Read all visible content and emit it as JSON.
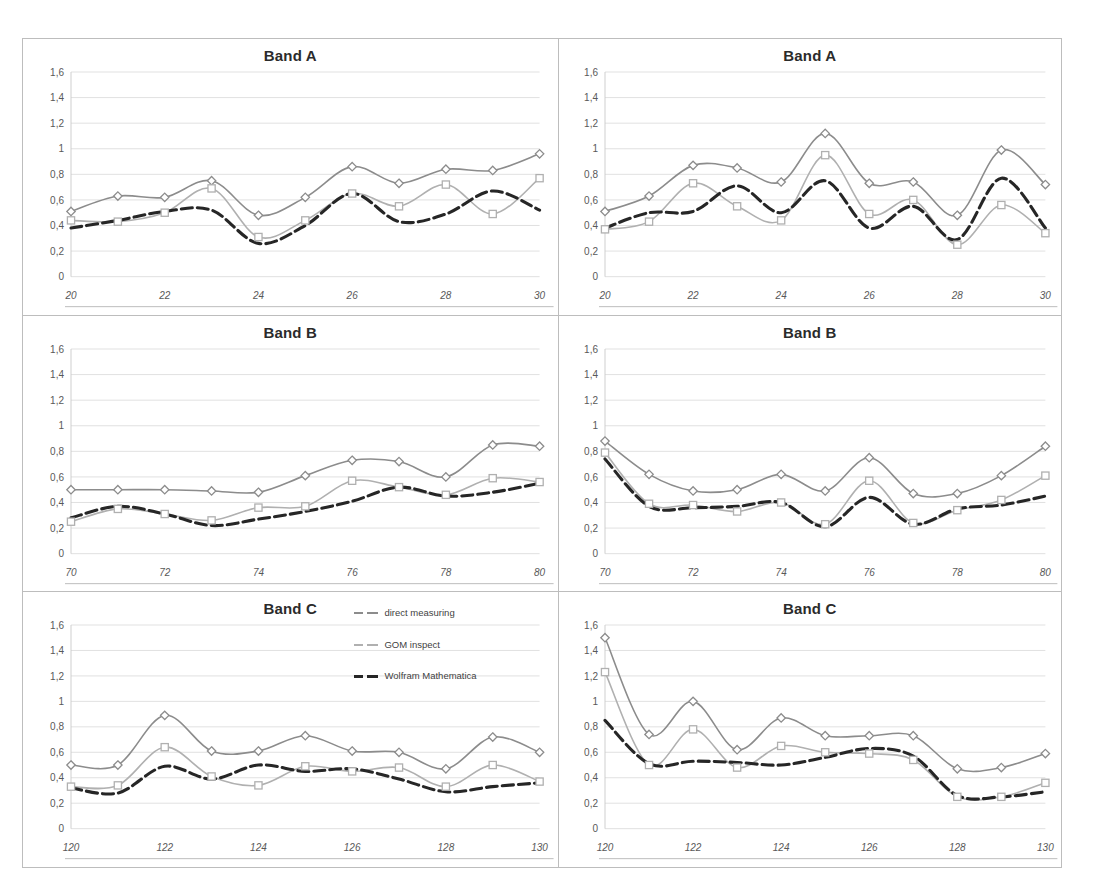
{
  "figure": {
    "panel_count": 6,
    "background": "#ffffff",
    "border_color": "#bdbdbd"
  },
  "legend": {
    "position": "bottom-left-panel-top-right",
    "items": [
      {
        "label": "direct measuring",
        "color": "#8c8c8c",
        "marker": "diamond"
      },
      {
        "label": "GOM inspect",
        "color": "#b0b0b0",
        "marker": "square"
      },
      {
        "label": "Wolfram Mathematica",
        "color": "#262626",
        "marker": "none"
      }
    ]
  },
  "axes": {
    "y_ticks": [
      "0",
      "0,2",
      "0,4",
      "0,6",
      "0,8",
      "1",
      "1,2",
      "1,4",
      "1,6"
    ],
    "y_values": [
      0,
      0.2,
      0.4,
      0.6,
      0.8,
      1.0,
      1.2,
      1.4,
      1.6
    ],
    "ylim": [
      0,
      1.6
    ],
    "grid": true,
    "grid_color": "#d9d9d9"
  },
  "chart_data": [
    {
      "id": "band-a-left",
      "type": "line",
      "title": "Band A",
      "xlabel": "",
      "ylabel": "",
      "xlim": [
        20,
        30
      ],
      "ylim": [
        0,
        1.6
      ],
      "x": [
        20,
        21,
        22,
        23,
        24,
        25,
        26,
        27,
        28,
        29,
        30
      ],
      "x_ticks": [
        "20",
        "22",
        "24",
        "26",
        "28",
        "30"
      ],
      "x_tick_values": [
        20,
        22,
        24,
        26,
        28,
        30
      ],
      "series": [
        {
          "name": "direct measuring",
          "values": [
            0.51,
            0.63,
            0.62,
            0.75,
            0.48,
            0.62,
            0.86,
            0.73,
            0.84,
            0.83,
            0.96
          ]
        },
        {
          "name": "GOM inspect",
          "values": [
            0.44,
            0.43,
            0.5,
            0.69,
            0.31,
            0.44,
            0.65,
            0.55,
            0.72,
            0.49,
            0.77
          ]
        },
        {
          "name": "Wolfram Mathematica",
          "values": [
            0.38,
            0.44,
            0.51,
            0.52,
            0.26,
            0.4,
            0.65,
            0.43,
            0.49,
            0.67,
            0.52
          ]
        }
      ]
    },
    {
      "id": "band-a-right",
      "type": "line",
      "title": "Band A",
      "xlabel": "",
      "ylabel": "",
      "xlim": [
        20,
        30
      ],
      "ylim": [
        0,
        1.6
      ],
      "x": [
        20,
        21,
        22,
        23,
        24,
        25,
        26,
        27,
        28,
        29,
        30
      ],
      "x_ticks": [
        "20",
        "22",
        "24",
        "26",
        "28",
        "30"
      ],
      "x_tick_values": [
        20,
        22,
        24,
        26,
        28,
        30
      ],
      "series": [
        {
          "name": "direct measuring",
          "values": [
            0.51,
            0.63,
            0.87,
            0.85,
            0.74,
            1.12,
            0.73,
            0.74,
            0.48,
            0.99,
            0.72
          ]
        },
        {
          "name": "GOM inspect",
          "values": [
            0.37,
            0.43,
            0.73,
            0.55,
            0.44,
            0.95,
            0.49,
            0.6,
            0.25,
            0.56,
            0.34
          ]
        },
        {
          "name": "Wolfram Mathematica",
          "values": [
            0.38,
            0.5,
            0.51,
            0.71,
            0.5,
            0.75,
            0.38,
            0.55,
            0.29,
            0.77,
            0.38
          ]
        }
      ]
    },
    {
      "id": "band-b-left",
      "type": "line",
      "title": "Band B",
      "xlabel": "",
      "ylabel": "",
      "xlim": [
        70,
        80
      ],
      "ylim": [
        0,
        1.6
      ],
      "x": [
        70,
        71,
        72,
        73,
        74,
        75,
        76,
        77,
        78,
        79,
        80
      ],
      "x_ticks": [
        "70",
        "72",
        "74",
        "76",
        "78",
        "80"
      ],
      "x_tick_values": [
        70,
        72,
        74,
        76,
        78,
        80
      ],
      "series": [
        {
          "name": "direct measuring",
          "values": [
            0.5,
            0.5,
            0.5,
            0.49,
            0.48,
            0.61,
            0.73,
            0.72,
            0.6,
            0.85,
            0.84
          ]
        },
        {
          "name": "GOM inspect",
          "values": [
            0.25,
            0.35,
            0.31,
            0.26,
            0.36,
            0.37,
            0.57,
            0.52,
            0.46,
            0.59,
            0.56
          ]
        },
        {
          "name": "Wolfram Mathematica",
          "values": [
            0.28,
            0.37,
            0.31,
            0.22,
            0.27,
            0.33,
            0.41,
            0.52,
            0.45,
            0.48,
            0.55
          ]
        }
      ]
    },
    {
      "id": "band-b-right",
      "type": "line",
      "title": "Band B",
      "xlabel": "",
      "ylabel": "",
      "xlim": [
        70,
        80
      ],
      "ylim": [
        0,
        1.6
      ],
      "x": [
        70,
        71,
        72,
        73,
        74,
        75,
        76,
        77,
        78,
        79,
        80
      ],
      "x_ticks": [
        "70",
        "72",
        "74",
        "76",
        "78",
        "80"
      ],
      "x_tick_values": [
        70,
        72,
        74,
        76,
        78,
        80
      ],
      "series": [
        {
          "name": "direct measuring",
          "values": [
            0.88,
            0.62,
            0.49,
            0.5,
            0.62,
            0.49,
            0.75,
            0.47,
            0.47,
            0.61,
            0.84
          ]
        },
        {
          "name": "GOM inspect",
          "values": [
            0.79,
            0.39,
            0.38,
            0.33,
            0.4,
            0.23,
            0.57,
            0.24,
            0.34,
            0.42,
            0.61
          ]
        },
        {
          "name": "Wolfram Mathematica",
          "values": [
            0.74,
            0.37,
            0.36,
            0.37,
            0.4,
            0.21,
            0.44,
            0.23,
            0.35,
            0.38,
            0.45
          ]
        }
      ]
    },
    {
      "id": "band-c-left",
      "type": "line",
      "title": "Band C",
      "xlabel": "",
      "ylabel": "",
      "xlim": [
        120,
        130
      ],
      "ylim": [
        0,
        1.6
      ],
      "x": [
        120,
        121,
        122,
        123,
        124,
        125,
        126,
        127,
        128,
        129,
        130
      ],
      "x_ticks": [
        "120",
        "122",
        "124",
        "126",
        "128",
        "130"
      ],
      "x_tick_values": [
        120,
        122,
        124,
        126,
        128,
        130
      ],
      "series": [
        {
          "name": "direct measuring",
          "values": [
            0.5,
            0.5,
            0.89,
            0.61,
            0.61,
            0.73,
            0.61,
            0.6,
            0.47,
            0.72,
            0.6
          ]
        },
        {
          "name": "GOM inspect",
          "values": [
            0.33,
            0.34,
            0.64,
            0.41,
            0.34,
            0.49,
            0.45,
            0.48,
            0.33,
            0.5,
            0.37
          ]
        },
        {
          "name": "Wolfram Mathematica",
          "values": [
            0.32,
            0.28,
            0.49,
            0.39,
            0.5,
            0.45,
            0.47,
            0.39,
            0.29,
            0.33,
            0.36
          ]
        }
      ]
    },
    {
      "id": "band-c-right",
      "type": "line",
      "title": "Band C",
      "xlabel": "",
      "ylabel": "",
      "xlim": [
        120,
        130
      ],
      "ylim": [
        0,
        1.6
      ],
      "x": [
        120,
        121,
        122,
        123,
        124,
        125,
        126,
        127,
        128,
        129,
        130
      ],
      "x_ticks": [
        "120",
        "122",
        "124",
        "126",
        "128",
        "130"
      ],
      "x_tick_values": [
        120,
        122,
        124,
        126,
        128,
        130
      ],
      "series": [
        {
          "name": "direct measuring",
          "values": [
            1.5,
            0.74,
            1.0,
            0.62,
            0.87,
            0.73,
            0.73,
            0.73,
            0.47,
            0.48,
            0.59
          ]
        },
        {
          "name": "GOM inspect",
          "values": [
            1.23,
            0.5,
            0.78,
            0.48,
            0.65,
            0.6,
            0.59,
            0.54,
            0.25,
            0.25,
            0.36
          ]
        },
        {
          "name": "Wolfram Mathematica",
          "values": [
            0.85,
            0.51,
            0.53,
            0.52,
            0.5,
            0.56,
            0.63,
            0.57,
            0.26,
            0.25,
            0.29
          ]
        }
      ]
    }
  ]
}
